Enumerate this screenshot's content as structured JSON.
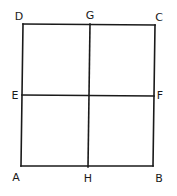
{
  "diagram": {
    "points": {
      "A": {
        "x": 21,
        "y": 166
      },
      "B": {
        "x": 153,
        "y": 166
      },
      "C": {
        "x": 155,
        "y": 25
      },
      "D": {
        "x": 23,
        "y": 24
      },
      "E": {
        "x": 22,
        "y": 95
      },
      "F": {
        "x": 154,
        "y": 96
      },
      "G": {
        "x": 90,
        "y": 24
      },
      "H": {
        "x": 88,
        "y": 167
      }
    },
    "labels": [
      {
        "id": "D",
        "text": "D",
        "x": 19,
        "y": 17
      },
      {
        "id": "G",
        "text": "G",
        "x": 90,
        "y": 16
      },
      {
        "id": "C",
        "text": "C",
        "x": 159,
        "y": 18
      },
      {
        "id": "E",
        "text": "E",
        "x": 15,
        "y": 96
      },
      {
        "id": "F",
        "text": "F",
        "x": 160,
        "y": 96
      },
      {
        "id": "A",
        "text": "A",
        "x": 16,
        "y": 178
      },
      {
        "id": "H",
        "text": "H",
        "x": 88,
        "y": 179
      },
      {
        "id": "B",
        "text": "B",
        "x": 159,
        "y": 179
      }
    ],
    "segments": [
      {
        "name": "side-DC",
        "from": "D",
        "to": "C"
      },
      {
        "name": "side-CB",
        "from": "C",
        "to": "B"
      },
      {
        "name": "side-BA",
        "from": "B",
        "to": "A"
      },
      {
        "name": "side-AD",
        "from": "A",
        "to": "D"
      },
      {
        "name": "midline-GH",
        "from": "G",
        "to": "H"
      },
      {
        "name": "midline-EF",
        "from": "E",
        "to": "F"
      }
    ],
    "colors": {
      "stroke": "#1a1a1a",
      "background": "#ffffff"
    }
  }
}
